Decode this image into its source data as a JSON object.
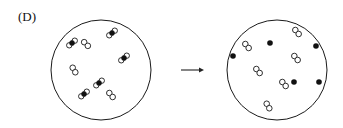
{
  "label": "(D)",
  "colors": {
    "stroke": "#1a1a1a",
    "fill_dark": "#111111",
    "background": "#ffffff"
  },
  "left_container": {
    "cx": 101,
    "cy": 70,
    "r": 50,
    "molecules": [
      {
        "type": "A-B",
        "x": 72,
        "y": 43,
        "angle": -40
      },
      {
        "type": "A-A",
        "x": 86,
        "y": 44,
        "angle": 45
      },
      {
        "type": "A-B",
        "x": 112,
        "y": 33,
        "angle": -40
      },
      {
        "type": "A-B",
        "x": 124,
        "y": 58,
        "angle": -40
      },
      {
        "type": "A-A",
        "x": 74,
        "y": 70,
        "angle": 60
      },
      {
        "type": "A-B",
        "x": 99,
        "y": 83,
        "angle": -40
      },
      {
        "type": "A-B",
        "x": 84,
        "y": 94,
        "angle": -40
      },
      {
        "type": "A-A",
        "x": 111,
        "y": 95,
        "angle": 50
      }
    ]
  },
  "arrow": {
    "x1": 181,
    "y1": 70,
    "x2": 204,
    "y2": 70
  },
  "right_container": {
    "cx": 277,
    "cy": 70,
    "r": 50,
    "molecules": [
      {
        "type": "A-A",
        "x": 297,
        "y": 32,
        "angle": 50
      },
      {
        "type": "A-A",
        "x": 247,
        "y": 46,
        "angle": 50
      },
      {
        "type": "A-A",
        "x": 296,
        "y": 58,
        "angle": 50
      },
      {
        "type": "A-A",
        "x": 258,
        "y": 71,
        "angle": 50
      },
      {
        "type": "A-A",
        "x": 284,
        "y": 84,
        "angle": 50
      },
      {
        "type": "A-A",
        "x": 268,
        "y": 106,
        "angle": 60
      }
    ],
    "atoms": [
      {
        "type": "B",
        "x": 270,
        "y": 43
      },
      {
        "type": "B",
        "x": 316,
        "y": 46
      },
      {
        "type": "B",
        "x": 233,
        "y": 56
      },
      {
        "type": "B",
        "x": 294,
        "y": 82
      },
      {
        "type": "B",
        "x": 319,
        "y": 82
      }
    ]
  }
}
